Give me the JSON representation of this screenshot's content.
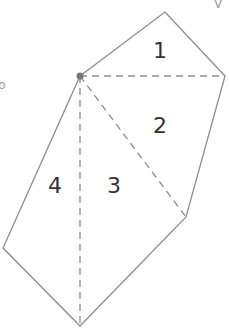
{
  "figure": {
    "type": "polygon-triangulation",
    "colors": {
      "edge": "#8c8c8c",
      "diagonal": "#8c8c8c",
      "label": "#333333",
      "vertex_dot": "#777777"
    },
    "regions": [
      {
        "label": "1"
      },
      {
        "label": "2"
      },
      {
        "label": "3"
      },
      {
        "label": "4"
      }
    ],
    "fragments": {
      "top_right": "V",
      "left": "o"
    }
  }
}
